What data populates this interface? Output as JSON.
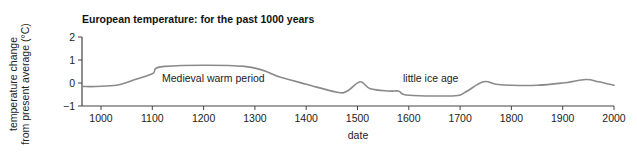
{
  "chart_data": {
    "type": "line",
    "title": "European temperature: for the past 1000 years",
    "xlabel": "date",
    "ylabel_lines": [
      "temperature change",
      "from present average (°C)"
    ],
    "xlim": [
      975,
      2000
    ],
    "ylim": [
      -1,
      2
    ],
    "xticks": [
      1000,
      1100,
      1200,
      1300,
      1400,
      1500,
      1600,
      1700,
      1800,
      1900,
      2000
    ],
    "yticks": [
      2,
      1,
      0,
      -1
    ],
    "ytick_labels": [
      "2",
      "1",
      "0",
      "−1"
    ],
    "grid": false,
    "legend": null,
    "series": [
      {
        "name": "European temperature",
        "color": "#8a8a8a",
        "x": [
          960,
          990,
          1030,
          1060,
          1100,
          1125,
          1280,
          1350,
          1400,
          1460,
          1480,
          1505,
          1525,
          1560,
          1580,
          1590,
          1620,
          1690,
          1710,
          1745,
          1770,
          1800,
          1850,
          1900,
          1945,
          1970,
          2000
        ],
        "y": [
          -0.15,
          -0.15,
          -0.1,
          0.1,
          0.4,
          0.72,
          0.72,
          0.25,
          -0.05,
          -0.4,
          -0.35,
          0.05,
          -0.25,
          -0.35,
          -0.35,
          -0.5,
          -0.55,
          -0.55,
          -0.4,
          0.05,
          -0.05,
          -0.1,
          -0.1,
          0.0,
          0.15,
          0.05,
          -0.1
        ]
      }
    ],
    "annotations": [
      {
        "text": "Medieval warm period",
        "x": 1200,
        "y": 0.15
      },
      {
        "text": "little ice age",
        "x": 1640,
        "y": 0.0
      }
    ]
  },
  "chart": {
    "title": "European temperature: for the past 1000 years",
    "ylabel_line1": "temperature change",
    "ylabel_line2": "from present average (°C)",
    "xlabel": "date",
    "annotation_medieval": "Medieval warm period",
    "annotation_ice_age": "little ice age",
    "colors": {
      "axis": "#444444",
      "curve": "#8a8a8a",
      "text": "#222222"
    }
  }
}
